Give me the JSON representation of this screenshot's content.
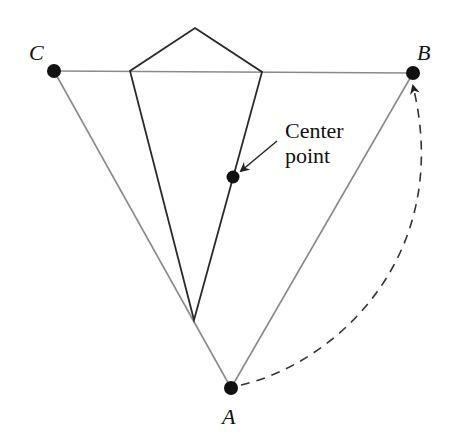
{
  "diagram": {
    "colors": {
      "triangle_stroke": "#8a8a8a",
      "kite_stroke": "#2a2a2a",
      "dot_fill": "#111111",
      "arc_stroke": "#333333",
      "text": "#111111"
    },
    "vertices": {
      "A": {
        "label": "A",
        "x": 231,
        "y": 388,
        "label_x": 222,
        "label_y": 424
      },
      "B": {
        "label": "B",
        "x": 413,
        "y": 73,
        "label_x": 417,
        "label_y": 60
      },
      "C": {
        "label": "C",
        "x": 54,
        "y": 71,
        "label_x": 29,
        "label_y": 60
      }
    },
    "kite": {
      "top": {
        "x": 195,
        "y": 28
      },
      "left": {
        "x": 130,
        "y": 71
      },
      "right": {
        "x": 262,
        "y": 72
      },
      "bottom": {
        "x": 194,
        "y": 320
      }
    },
    "center_point": {
      "x": 233,
      "y": 177,
      "label_line1": "Center",
      "label_line2": "point"
    },
    "rotation_arc": {
      "style": "dashed",
      "from": "A",
      "to": "B"
    }
  }
}
